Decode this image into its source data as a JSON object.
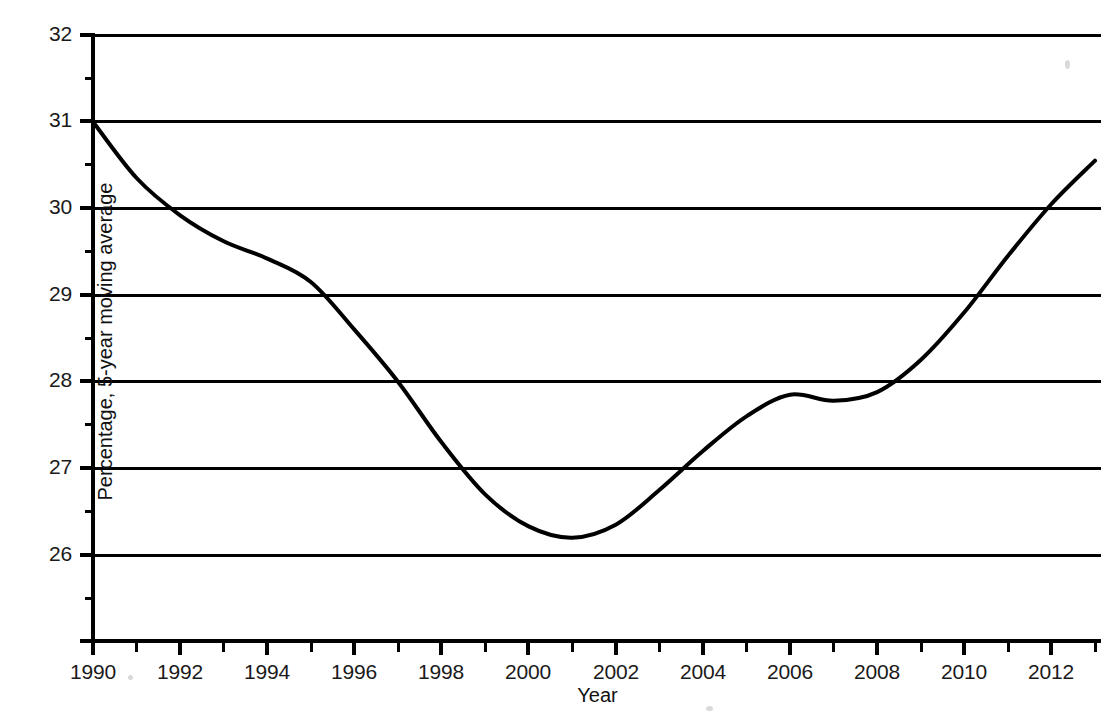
{
  "chart_data": {
    "type": "line",
    "title": "",
    "subtitle": "",
    "xlabel": "Year",
    "ylabel": "Percentage, 5-year moving average",
    "xlim": [
      1990,
      2013
    ],
    "ylim": [
      25.3,
      32.05
    ],
    "grid": "horizontal",
    "legend": "none",
    "x_ticks": [
      1990,
      1992,
      1994,
      1996,
      1998,
      2000,
      2002,
      2004,
      2006,
      2008,
      2010,
      2012
    ],
    "x_tick_labels": [
      "1990",
      "1992",
      "1994",
      "1996",
      "1998",
      "2000",
      "2002",
      "2004",
      "2006",
      "2008",
      "2010",
      "2012"
    ],
    "x_minor_ticks": [
      1991,
      1993,
      1995,
      1997,
      1999,
      2001,
      2003,
      2005,
      2007,
      2009,
      2011,
      2013
    ],
    "y_ticks": [
      26,
      27,
      28,
      29,
      30,
      31,
      32
    ],
    "y_tick_labels": [
      "26",
      "27",
      "28",
      "29",
      "30",
      "31",
      "32"
    ],
    "y_minor_ticks": [
      25.5,
      26.5,
      27.5,
      28.5,
      29.5,
      30.5,
      31.5
    ],
    "gridline_values": [
      26,
      27,
      28,
      29,
      30,
      31,
      32
    ],
    "series": [
      {
        "name": "Percentage, 5-year moving average",
        "color": "#000000",
        "x": [
          1990,
          1991,
          1992,
          1993,
          1994,
          1995,
          1996,
          1997,
          1998,
          1999,
          2000,
          2001,
          2002,
          2003,
          2004,
          2005,
          2006,
          2007,
          2008,
          2009,
          2010,
          2011,
          2012,
          2013
        ],
        "values": [
          31.0,
          30.35,
          29.92,
          29.62,
          29.42,
          29.15,
          28.6,
          28.0,
          27.3,
          26.7,
          26.33,
          26.2,
          26.35,
          26.75,
          27.2,
          27.6,
          27.85,
          27.78,
          27.88,
          28.25,
          28.8,
          29.45,
          30.05,
          30.55
        ]
      }
    ],
    "annotations": {
      "start_value": 31.0,
      "start_year": 1990,
      "minimum_value": 26.2,
      "minimum_year": 2001,
      "local_max_value": 27.85,
      "local_max_year": 2006,
      "local_dip_value": 27.78,
      "local_dip_year": 2007,
      "end_value": 30.55,
      "end_year": 2013
    }
  },
  "colors": {
    "line": "#000000",
    "grid": "#000000",
    "axis": "#000000",
    "background": "#ffffff",
    "text": "#111111"
  }
}
